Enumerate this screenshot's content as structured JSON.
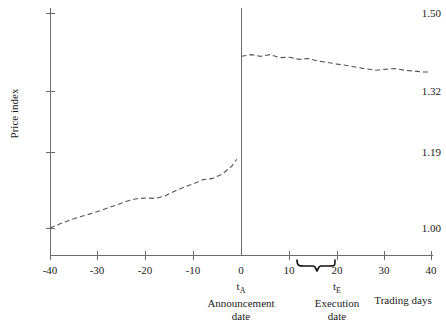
{
  "chart_data": {
    "type": "line",
    "title": "",
    "xlabel": "Trading days",
    "ylabel": "Price index",
    "xlim": [
      -40,
      40
    ],
    "ylim": [
      1.0,
      1.5
    ],
    "grid": false,
    "legend": null,
    "x_ticks": [
      -40,
      -30,
      -20,
      -10,
      0,
      10,
      20,
      30,
      40
    ],
    "x_tick_labels": [
      "-40",
      "-30",
      "-20",
      "-10",
      "0",
      "10",
      "20",
      "30",
      "40"
    ],
    "y_ticks": [
      1.0,
      1.19,
      1.32,
      1.5
    ],
    "y_tick_labels": [
      "1.00",
      "1.19",
      "1.32",
      "1.50"
    ],
    "line_style": "dashed",
    "line_color": "#555555",
    "series": [
      {
        "name": "pre-announcement price index",
        "x": [
          -40,
          -38,
          -36,
          -34,
          -32,
          -30,
          -28,
          -26,
          -24,
          -22,
          -20,
          -18,
          -16,
          -14,
          -12,
          -10,
          -8,
          -6,
          -4,
          -2,
          -1
        ],
        "values": [
          1.0,
          1.01,
          1.019,
          1.027,
          1.034,
          1.041,
          1.05,
          1.058,
          1.067,
          1.073,
          1.075,
          1.074,
          1.08,
          1.092,
          1.102,
          1.111,
          1.121,
          1.124,
          1.135,
          1.155,
          1.172
        ]
      },
      {
        "name": "post-announcement price index",
        "x": [
          0,
          2,
          4,
          6,
          8,
          10,
          12,
          14,
          16,
          18,
          20,
          22,
          24,
          26,
          28,
          30,
          32,
          34,
          36,
          38,
          39
        ],
        "values": [
          1.4,
          1.404,
          1.4,
          1.404,
          1.397,
          1.398,
          1.393,
          1.395,
          1.389,
          1.386,
          1.382,
          1.379,
          1.375,
          1.371,
          1.368,
          1.37,
          1.372,
          1.368,
          1.366,
          1.364,
          1.364
        ]
      }
    ],
    "annotations": [
      {
        "name": "announcement-date",
        "x": 0,
        "symbol": "t",
        "subscript": "A",
        "line1": "Announcement",
        "line2": "date",
        "marker": "vertical-line"
      },
      {
        "name": "execution-date",
        "x_range": [
          13,
          20
        ],
        "symbol": "t",
        "subscript": "E",
        "line1": "Execution",
        "line2": "date",
        "marker": "brace"
      }
    ]
  },
  "axes": {
    "y_title": "Price index",
    "x_title": "Trading days"
  }
}
